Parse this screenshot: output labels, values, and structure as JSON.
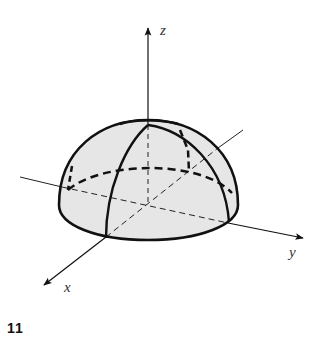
{
  "figure": {
    "number": "11",
    "axes": {
      "x_label": "x",
      "y_label": "y",
      "z_label": "z"
    },
    "colors": {
      "fill": "#e6e6e6",
      "stroke": "#111111",
      "background": "#ffffff"
    }
  }
}
